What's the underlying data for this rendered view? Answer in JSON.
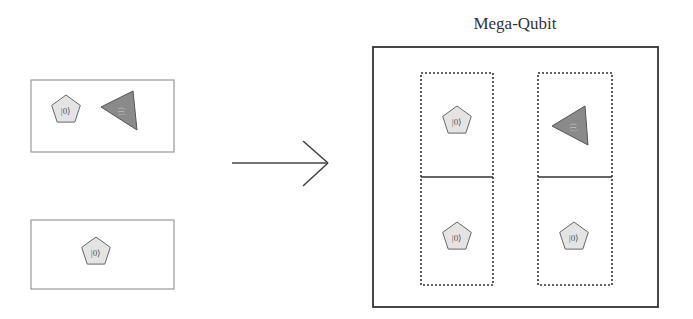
{
  "diagram": {
    "title": "Mega-Qubit",
    "colors": {
      "stroke": "#444444",
      "light_box_stroke": "#9a9a9a",
      "pentagon_fill": "#e4e4e4",
      "triangle_fill": "#8a8a8a",
      "label": "#555555"
    },
    "left_groups": [
      {
        "name": "top-qubit-group",
        "shapes": [
          {
            "type": "pentagon",
            "label": "|0⟩"
          },
          {
            "type": "triangle",
            "label": "|1⟩"
          }
        ]
      },
      {
        "name": "bottom-qubit-group",
        "shapes": [
          {
            "type": "pentagon",
            "label": "|0⟩"
          }
        ]
      }
    ],
    "arrow": {
      "direction": "right"
    },
    "mega_qubit": {
      "columns": [
        {
          "cells": [
            {
              "type": "pentagon",
              "label": "|0⟩"
            },
            {
              "type": "pentagon",
              "label": "|0⟩"
            }
          ]
        },
        {
          "cells": [
            {
              "type": "triangle",
              "label": "|1⟩"
            },
            {
              "type": "pentagon",
              "label": "|0⟩"
            }
          ]
        }
      ]
    }
  }
}
